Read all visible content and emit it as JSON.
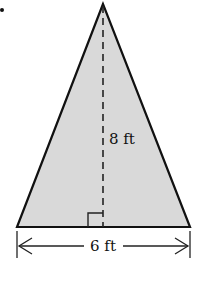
{
  "figure": {
    "shape": "isosceles-triangle",
    "fill_color": "#d9d9d9",
    "stroke_color": "#111111",
    "height_label": "8 ft",
    "base_label": "6 ft"
  }
}
